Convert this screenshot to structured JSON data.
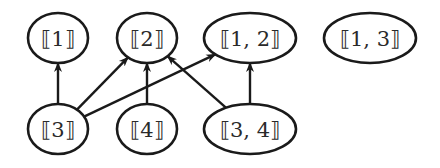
{
  "diagram": {
    "type": "directed-graph",
    "colors": {
      "stroke": "#1a1a1a",
      "text": "#2a2a2a",
      "background": "#ffffff"
    },
    "nodes": [
      {
        "id": "n1",
        "label": "⟦1⟧",
        "cx": 58,
        "cy": 38,
        "rx": 30,
        "ry": 25
      },
      {
        "id": "n2",
        "label": "⟦2⟧",
        "cx": 147,
        "cy": 38,
        "rx": 30,
        "ry": 25
      },
      {
        "id": "n12",
        "label": "⟦1, 2⟧",
        "cx": 250,
        "cy": 38,
        "rx": 46,
        "ry": 25
      },
      {
        "id": "n13",
        "label": "⟦1, 3⟧",
        "cx": 370,
        "cy": 38,
        "rx": 46,
        "ry": 25
      },
      {
        "id": "n3",
        "label": "⟦3⟧",
        "cx": 58,
        "cy": 129,
        "rx": 30,
        "ry": 25
      },
      {
        "id": "n4",
        "label": "⟦4⟧",
        "cx": 147,
        "cy": 129,
        "rx": 30,
        "ry": 25
      },
      {
        "id": "n34",
        "label": "⟦3, 4⟧",
        "cx": 250,
        "cy": 129,
        "rx": 46,
        "ry": 25
      }
    ],
    "edges": [
      {
        "from": "n3",
        "to": "n1"
      },
      {
        "from": "n3",
        "to": "n2"
      },
      {
        "from": "n3",
        "to": "n12"
      },
      {
        "from": "n4",
        "to": "n2"
      },
      {
        "from": "n34",
        "to": "n2"
      },
      {
        "from": "n34",
        "to": "n12"
      }
    ]
  }
}
